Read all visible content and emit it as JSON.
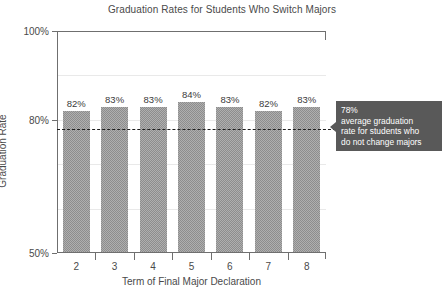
{
  "chart_data": {
    "type": "bar",
    "title": "Graduation Rates for Students Who Switch Majors",
    "xlabel": "Term of Final Major Declaration",
    "ylabel": "Graduation Rate",
    "categories": [
      "2",
      "3",
      "4",
      "5",
      "6",
      "7",
      "8"
    ],
    "values": [
      82,
      83,
      83,
      84,
      83,
      82,
      83
    ],
    "value_labels": [
      "82%",
      "83%",
      "83%",
      "84%",
      "83%",
      "82%",
      "83%"
    ],
    "ylim": [
      50,
      100
    ],
    "ytick_labels": [
      "100%",
      "80%",
      "50%"
    ],
    "ytick_values": [
      100,
      80,
      50
    ],
    "gridlines": [
      90,
      80,
      70,
      60
    ],
    "grid": true,
    "legend": "none",
    "bar_color": "#8d8d8d",
    "reference_line": {
      "value": 78,
      "style": "dashed",
      "color": "#1f1f1f",
      "label_lines": [
        "78%",
        "average graduation",
        "rate for students who",
        "do not change majors"
      ],
      "box_color": "#595959",
      "text_color": "#ffffff"
    }
  },
  "annotation": {
    "line1": "78%",
    "line2": "average graduation",
    "line3": "rate for students who",
    "line4": "do not change majors"
  },
  "axis": {
    "y_label_top": "100%",
    "y_label_mid": "80%",
    "y_label_bottom": "50%",
    "y_title": "Graduation Rate",
    "x_title": "Term of Final Major Declaration"
  },
  "bars": [
    {
      "category": "2",
      "label": "82%"
    },
    {
      "category": "3",
      "label": "83%"
    },
    {
      "category": "4",
      "label": "83%"
    },
    {
      "category": "5",
      "label": "84%"
    },
    {
      "category": "6",
      "label": "83%"
    },
    {
      "category": "7",
      "label": "82%"
    },
    {
      "category": "8",
      "label": "83%"
    }
  ],
  "title": "Graduation Rates for Students Who Switch Majors"
}
